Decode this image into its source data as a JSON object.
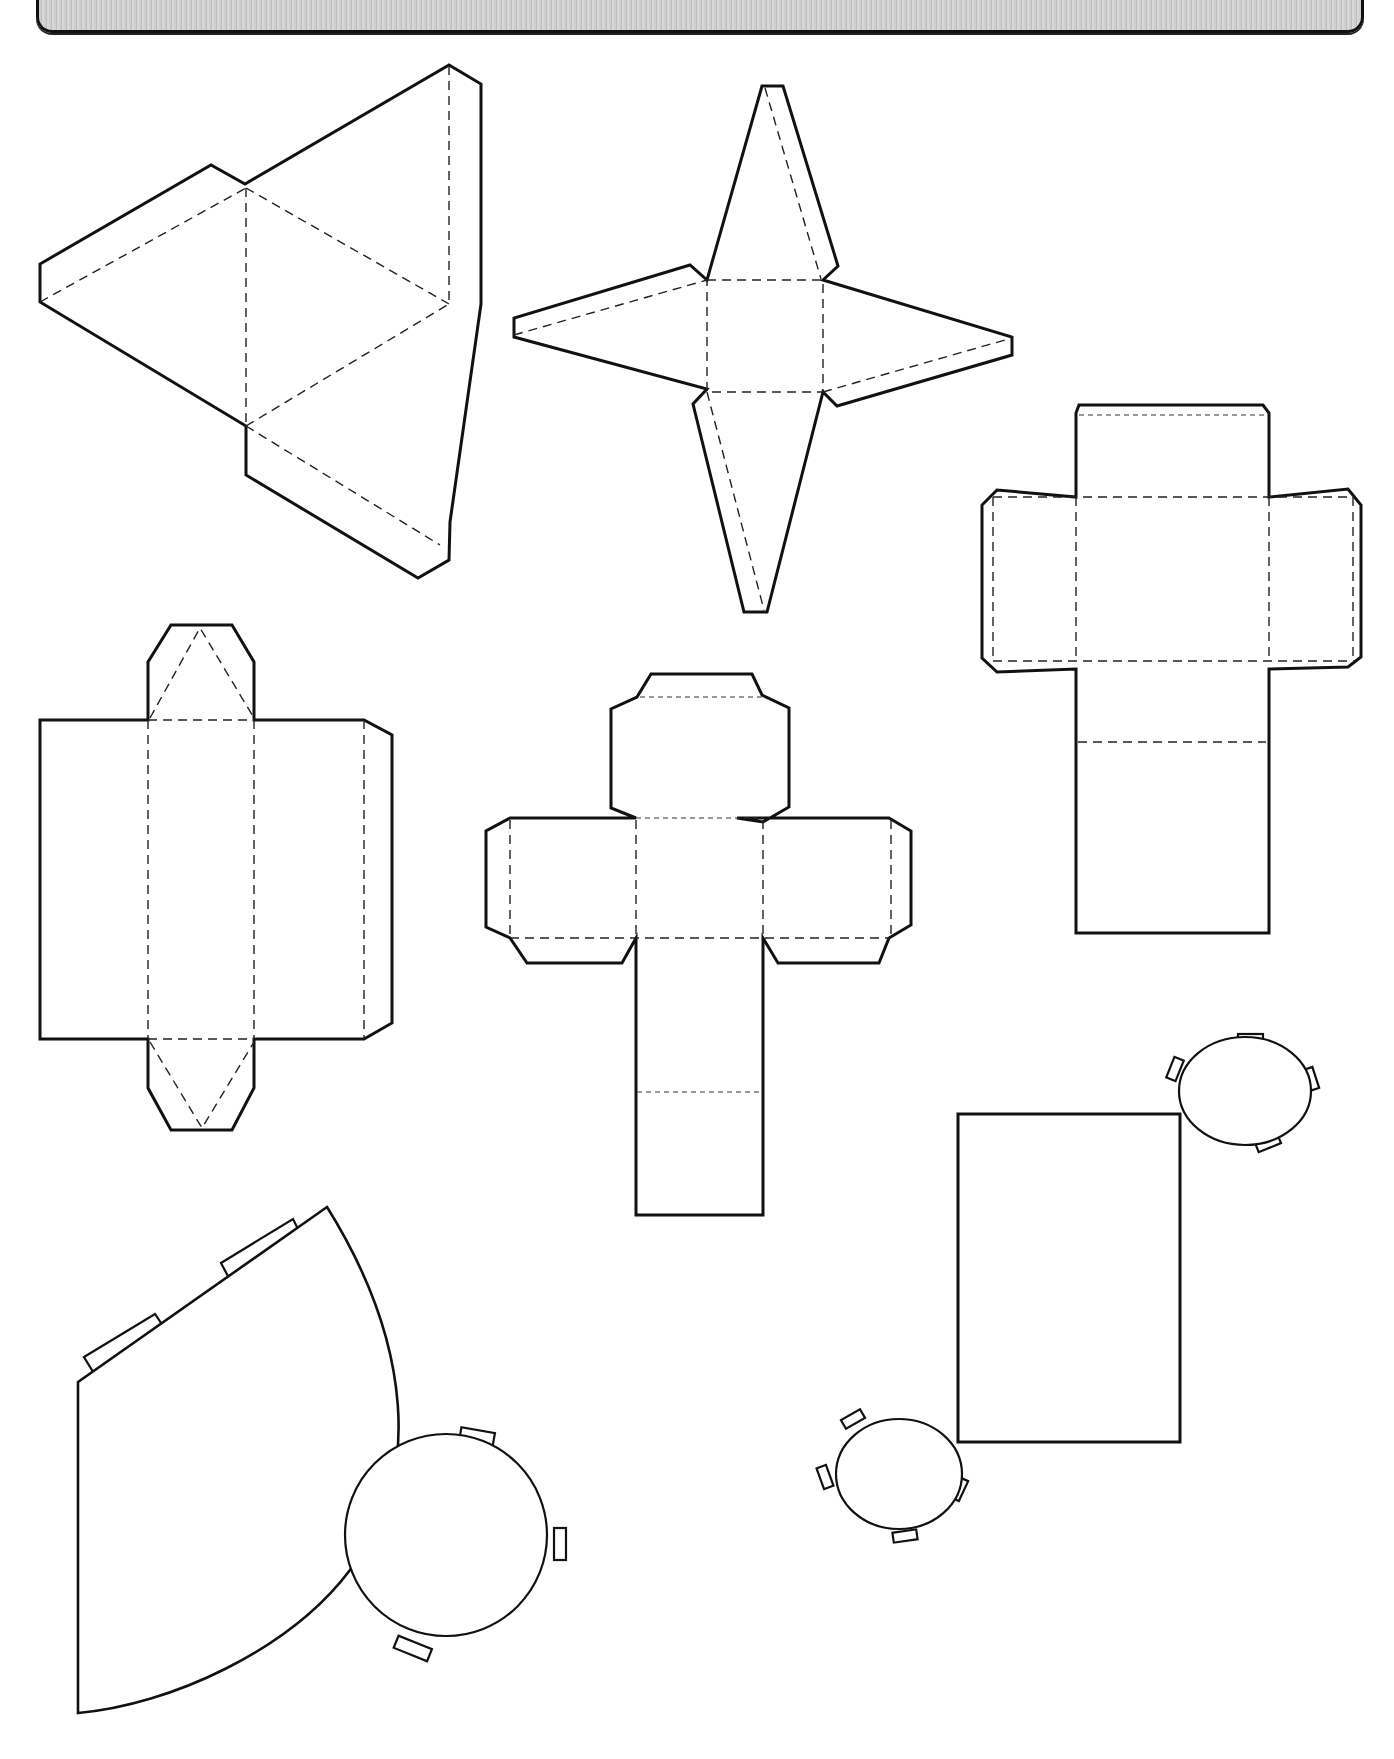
{
  "header": {
    "title": "",
    "band_color": "#c8c8c8",
    "border_color": "#111111"
  },
  "nets": [
    {
      "id": "triangular-pyramid",
      "name": "Triangular pyramid (tetrahedron) net",
      "faces": 4,
      "glue_tabs": 3
    },
    {
      "id": "square-pyramid",
      "name": "Square pyramid net",
      "faces": 5,
      "glue_tabs": 3
    },
    {
      "id": "rectangular-prism-right",
      "name": "Rectangular prism net",
      "faces": 6,
      "glue_tabs": 5
    },
    {
      "id": "triangular-prism",
      "name": "Triangular prism net",
      "faces": 5,
      "glue_tabs": 3
    },
    {
      "id": "cube",
      "name": "Cube net",
      "faces": 6,
      "glue_tabs": 5
    },
    {
      "id": "cone",
      "name": "Cone net",
      "faces": 2,
      "glue_tabs": 6
    },
    {
      "id": "cylinder",
      "name": "Cylinder net",
      "faces": 3,
      "glue_tabs": 8
    }
  ],
  "legend": {
    "solid_line": "cut",
    "dashed_line": "fold"
  }
}
